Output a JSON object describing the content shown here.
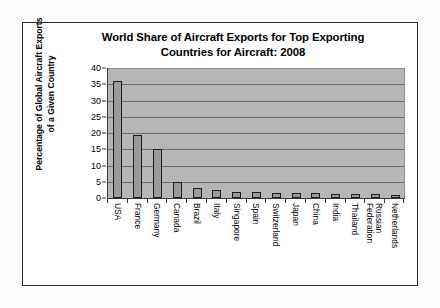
{
  "chart_data": {
    "type": "bar",
    "title": "World Share of Aircraft Exports for Top Exporting Countries for Aircraft: 2008",
    "title_lines": [
      "World Share of Aircraft Exports for Top Exporting",
      "Countries for Aircraft: 2008"
    ],
    "xlabel": "",
    "ylabel": "Percentage of Global Aircraft Exports of a Given Country",
    "ylabel_lines": [
      "Percentage of Global Aircraft Exports",
      "of a Given Country"
    ],
    "ylim": [
      0,
      40
    ],
    "ytick_values": [
      40,
      35,
      30,
      25,
      20,
      15,
      10,
      5,
      0
    ],
    "grid": true,
    "legend": false,
    "categories": [
      "USA",
      "France",
      "Germany",
      "Canada",
      "Brazil",
      "Italy",
      "Singapore",
      "Spain",
      "Switzerland",
      "Japan",
      "China",
      "India",
      "Thailand",
      "Russian Federation",
      "Netherlands"
    ],
    "category_label_lines": [
      [
        "USA"
      ],
      [
        "France"
      ],
      [
        "Germany"
      ],
      [
        "Canada"
      ],
      [
        "Brazil"
      ],
      [
        "Italy"
      ],
      [
        "Singapore"
      ],
      [
        "Spain"
      ],
      [
        "Switzerland"
      ],
      [
        "Japan"
      ],
      [
        "China"
      ],
      [
        "India"
      ],
      [
        "Thailand"
      ],
      [
        "Russian",
        "Federation"
      ],
      [
        "Netherlands"
      ]
    ],
    "values": [
      36,
      19.5,
      15,
      5,
      3,
      2.5,
      1.8,
      1.7,
      1.6,
      1.5,
      1.4,
      1.3,
      1.2,
      1.1,
      1.0
    ],
    "colors": {
      "bar_fill": "#9a9a9a",
      "bar_edge": "#1c1c1c",
      "plot_background": "#b6b6b6",
      "gridline": "#5e5e5e",
      "axis": "#3a3a3a",
      "frame": "#2b2b2b",
      "page_background": "#fdfdfc",
      "text": "#000000"
    }
  }
}
